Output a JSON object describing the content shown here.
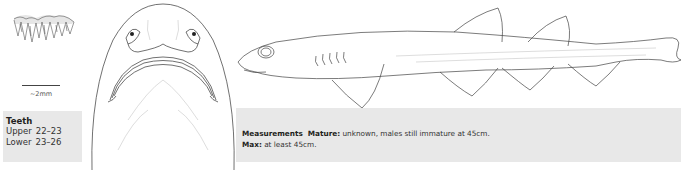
{
  "scale": {
    "label": "~2mm"
  },
  "teeth": {
    "title": "Teeth",
    "rows": [
      {
        "label": "Upper",
        "value": "22–23"
      },
      {
        "label": "Lower",
        "value": "23–26"
      }
    ]
  },
  "measurements": {
    "title": "Measurements",
    "mature_label": "Mature:",
    "mature_value": "unknown, males still immature at 45cm.",
    "max_label": "Max:",
    "max_value": "at least 45cm."
  },
  "illustrations": {
    "teeth": "teeth-illustration",
    "ventral": "ventral-head-illustration",
    "lateral": "lateral-shark-illustration"
  }
}
